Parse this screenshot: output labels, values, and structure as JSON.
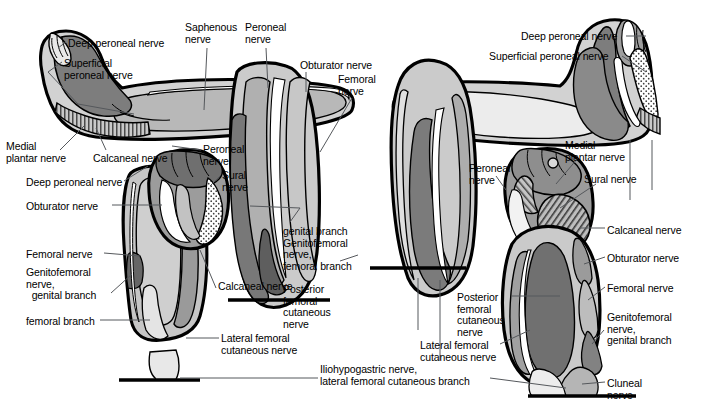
{
  "figure": {
    "views": [
      "anterior",
      "posterior"
    ],
    "background_color": "#ffffff",
    "line_color": "#000000",
    "leader_color": "#55585c"
  },
  "palette": {
    "outline": "#000000",
    "white": "#ffffff",
    "very_light_gray": "#efefef",
    "light_gray": "#d9d9d9",
    "mid_gray": "#b3b3b3",
    "gray": "#999999",
    "dark_gray": "#6e6e6e",
    "darker_gray": "#545454",
    "hatch_gray": "#8c8c8c",
    "stipple_gray": "#a8a8a8"
  },
  "labels": [
    {
      "id": "deep-peroneal-nerve-tl",
      "text": "Deep peroneal nerve",
      "x": 68,
      "y": 38,
      "align": "left"
    },
    {
      "id": "superficial-peroneal-nerve-tl",
      "text": "Superficial\nperoneal nerve",
      "x": 64,
      "y": 58,
      "align": "left"
    },
    {
      "id": "saphenous-nerve",
      "text": "Saphenous\nnerve",
      "x": 185,
      "y": 22,
      "align": "left"
    },
    {
      "id": "peroneal-nerve-top",
      "text": "Peroneal\nnerve",
      "x": 245,
      "y": 22,
      "align": "left"
    },
    {
      "id": "obturator-nerve-top",
      "text": "Obturator nerve",
      "x": 300,
      "y": 60,
      "align": "left"
    },
    {
      "id": "femoral-nerve-top",
      "text": "Femoral\nnerve",
      "x": 338,
      "y": 74,
      "align": "left"
    },
    {
      "id": "medial-plantar-nerve-left",
      "text": "Medial\nplantar nerve",
      "x": 6,
      "y": 141,
      "align": "left"
    },
    {
      "id": "calcaneal-nerve-left",
      "text": "Calcaneal nerve",
      "x": 93,
      "y": 153,
      "align": "left"
    },
    {
      "id": "peroneal-nerve-mid-left",
      "text": "Peroneal\nnerve",
      "x": 203,
      "y": 144,
      "align": "left"
    },
    {
      "id": "sural-nerve-left",
      "text": "Sural\nnerve",
      "x": 222,
      "y": 170,
      "align": "left"
    },
    {
      "id": "deep-peroneal-nerve-left2",
      "text": "Deep peroneal nerve",
      "x": 26,
      "y": 177,
      "align": "left"
    },
    {
      "id": "obturator-nerve-left",
      "text": "Obturator nerve",
      "x": 26,
      "y": 201,
      "align": "left"
    },
    {
      "id": "femoral-nerve-left",
      "text": "Femoral nerve",
      "x": 26,
      "y": 249,
      "align": "left"
    },
    {
      "id": "genitofemoral-genital-left",
      "text": "Genitofemoral\nnerve,\n  genital branch",
      "x": 26,
      "y": 267,
      "align": "left"
    },
    {
      "id": "femoral-branch-left",
      "text": "femoral branch",
      "x": 26,
      "y": 316,
      "align": "left"
    },
    {
      "id": "calcaneal-nerve-center",
      "text": "Calcaneal nerve",
      "x": 218,
      "y": 281,
      "align": "left"
    },
    {
      "id": "lateral-femoral-cutaneous-left",
      "text": "Lateral femoral\ncutaneous nerve",
      "x": 221,
      "y": 333,
      "align": "left"
    },
    {
      "id": "genital-branch-center",
      "text": "genital branch\nGenitofemoral\nnerve,\nfemoral branch",
      "x": 283,
      "y": 226,
      "align": "left"
    },
    {
      "id": "posterior-femoral-cutaneous-center",
      "text": "Posterior\nfemoral\ncutaneous\nnerve",
      "x": 283,
      "y": 284,
      "align": "left"
    },
    {
      "id": "iliohypogastric-nerve",
      "text": "Iliohypogastric nerve,\nlateral femoral cutaneous branch",
      "x": 320,
      "y": 364,
      "align": "left"
    },
    {
      "id": "deep-peroneal-nerve-tr",
      "text": "Deep peroneal nerve",
      "x": 521,
      "y": 31,
      "align": "left"
    },
    {
      "id": "superficial-peroneal-nerve-tr",
      "text": "Superficial peroneal nerve",
      "x": 489,
      "y": 51,
      "align": "left"
    },
    {
      "id": "peroneal-nerve-right",
      "text": "Peroneal\nnerve",
      "x": 469,
      "y": 163,
      "align": "left"
    },
    {
      "id": "medial-plantar-nerve-right",
      "text": "Medial\nplantar nerve",
      "x": 565,
      "y": 140,
      "align": "left"
    },
    {
      "id": "sural-nerve-right",
      "text": "Sural nerve",
      "x": 584,
      "y": 174,
      "align": "left"
    },
    {
      "id": "calcaneal-nerve-right",
      "text": "Calcaneal nerve",
      "x": 607,
      "y": 225,
      "align": "left"
    },
    {
      "id": "obturator-nerve-right",
      "text": "Obturator nerve",
      "x": 607,
      "y": 253,
      "align": "left"
    },
    {
      "id": "femoral-nerve-right",
      "text": "Femoral nerve",
      "x": 607,
      "y": 283,
      "align": "left"
    },
    {
      "id": "genitofemoral-genital-right",
      "text": "Genitofemoral\nnerve,\ngenital branch",
      "x": 607,
      "y": 312,
      "align": "left"
    },
    {
      "id": "cluneal-nerve-right",
      "text": "Cluneal\nnerve",
      "x": 607,
      "y": 378,
      "align": "left"
    },
    {
      "id": "posterior-femoral-cutaneous-right",
      "text": "Posterior\nfemoral\ncutaneous\nnerve",
      "x": 457,
      "y": 292,
      "align": "left"
    },
    {
      "id": "lateral-femoral-cutaneous-right",
      "text": "Lateral femoral\ncutaneous nerve",
      "x": 420,
      "y": 340,
      "align": "left"
    }
  ]
}
